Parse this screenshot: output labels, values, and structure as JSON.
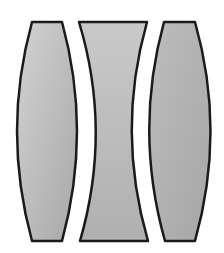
{
  "diagram": {
    "elements": [
      {
        "name": "left-biconvex-lens",
        "type": "biconvex",
        "fill": "#b8b8b8"
      },
      {
        "name": "middle-biconcave-lens",
        "type": "biconcave",
        "fill": "#bdbdbd"
      },
      {
        "name": "right-biconvex-lens",
        "type": "biconvex",
        "fill": "#b8b8b8"
      }
    ],
    "stroke": "#1a1a1a"
  }
}
